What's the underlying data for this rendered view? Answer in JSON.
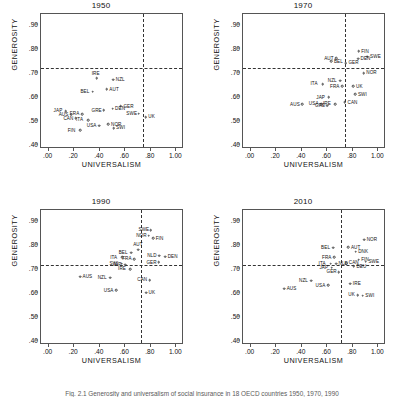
{
  "figure": {
    "caption": "Fig. 2.1 Generosity and universalism of social insurance in 18 OECD countries 1950, 1970, 1990",
    "axis_x_label": "UNIVERSALISM",
    "axis_y_label": "GENEROSITY",
    "xticks": [
      ".00",
      ".20",
      ".40",
      ".60",
      ".80",
      "1.00"
    ],
    "xtick_values": [
      0.0,
      0.2,
      0.4,
      0.6,
      0.8,
      1.0
    ],
    "yticks": [
      ".40",
      ".50",
      ".60",
      ".70",
      ".80",
      ".90"
    ],
    "ytick_values": [
      0.4,
      0.5,
      0.6,
      0.7,
      0.8,
      0.9
    ]
  },
  "chart_data": {
    "type": "scatter",
    "xlabel": "UNIVERSALISM",
    "ylabel": "GENEROSITY",
    "xlim": [
      -0.06,
      1.06
    ],
    "ylim": [
      0.385,
      0.945
    ],
    "grid": false,
    "legend": "none",
    "reference_lines": {
      "vertical_x": 0.74,
      "horizontal_y": 0.723,
      "style": "dashed"
    },
    "panels": [
      {
        "title": "1950",
        "reference_x": 0.735,
        "reference_y": 0.723,
        "points": [
          {
            "label": "NZL",
            "x": 0.505,
            "y": 0.672,
            "label_pos": "right"
          },
          {
            "label": "IRE",
            "x": 0.375,
            "y": 0.678,
            "label_pos": "above"
          },
          {
            "label": "AUT",
            "x": 0.455,
            "y": 0.632,
            "label_pos": "right"
          },
          {
            "label": "BEL",
            "x": 0.345,
            "y": 0.622,
            "label_pos": "left"
          },
          {
            "label": "GER",
            "x": 0.565,
            "y": 0.562,
            "label_pos": "right"
          },
          {
            "label": "DEN",
            "x": 0.5,
            "y": 0.552,
            "label_pos": "right"
          },
          {
            "label": "GRE",
            "x": 0.432,
            "y": 0.545,
            "label_pos": "left"
          },
          {
            "label": "SWE",
            "x": 0.705,
            "y": 0.532,
            "label_pos": "left"
          },
          {
            "label": "UK",
            "x": 0.76,
            "y": 0.518,
            "label_pos": "right"
          },
          {
            "label": "JAP",
            "x": 0.135,
            "y": 0.543,
            "label_pos": "left"
          },
          {
            "label": "AUS",
            "x": 0.175,
            "y": 0.528,
            "label_pos": "left"
          },
          {
            "label": "FRA",
            "x": 0.262,
            "y": 0.53,
            "label_pos": "left"
          },
          {
            "label": "CAN",
            "x": 0.212,
            "y": 0.512,
            "label_pos": "left"
          },
          {
            "label": "ITA",
            "x": 0.31,
            "y": 0.505,
            "label_pos": "left"
          },
          {
            "label": "USA",
            "x": 0.395,
            "y": 0.482,
            "label_pos": "left"
          },
          {
            "label": "NOR",
            "x": 0.468,
            "y": 0.487,
            "label_pos": "right"
          },
          {
            "label": "SWI",
            "x": 0.508,
            "y": 0.472,
            "label_pos": "right"
          },
          {
            "label": "FIN",
            "x": 0.245,
            "y": 0.463,
            "label_pos": "left"
          }
        ]
      },
      {
        "title": "1970",
        "reference_x": 0.735,
        "reference_y": 0.723,
        "points": [
          {
            "label": "SWE",
            "x": 0.915,
            "y": 0.768,
            "label_pos": "right"
          },
          {
            "label": "FIN",
            "x": 0.845,
            "y": 0.79,
            "label_pos": "right"
          },
          {
            "label": "DEN",
            "x": 0.84,
            "y": 0.76,
            "label_pos": "right"
          },
          {
            "label": "NOR",
            "x": 0.885,
            "y": 0.7,
            "label_pos": "right"
          },
          {
            "label": "AUT",
            "x": 0.672,
            "y": 0.762,
            "label_pos": "left"
          },
          {
            "label": "BEL",
            "x": 0.632,
            "y": 0.748,
            "label_pos": "right"
          },
          {
            "label": "GER",
            "x": 0.745,
            "y": 0.742,
            "label_pos": "right"
          },
          {
            "label": "NZL",
            "x": 0.7,
            "y": 0.668,
            "label_pos": "left"
          },
          {
            "label": "ITA",
            "x": 0.565,
            "y": 0.655,
            "label_pos": "left"
          },
          {
            "label": "FRA",
            "x": 0.718,
            "y": 0.645,
            "label_pos": "left"
          },
          {
            "label": "UK",
            "x": 0.805,
            "y": 0.645,
            "label_pos": "right"
          },
          {
            "label": "SWI",
            "x": 0.82,
            "y": 0.612,
            "label_pos": "right"
          },
          {
            "label": "JAP",
            "x": 0.61,
            "y": 0.6,
            "label_pos": "left"
          },
          {
            "label": "AUS",
            "x": 0.405,
            "y": 0.57,
            "label_pos": "left"
          },
          {
            "label": "USA",
            "x": 0.552,
            "y": 0.572,
            "label_pos": "left"
          },
          {
            "label": "IRE",
            "x": 0.662,
            "y": 0.572,
            "label_pos": "left"
          },
          {
            "label": "CAN",
            "x": 0.738,
            "y": 0.578,
            "label_pos": "right"
          },
          {
            "label": "GRE",
            "x": 0.6,
            "y": 0.565,
            "label_pos": "left"
          }
        ]
      },
      {
        "title": "1990",
        "reference_x": 0.725,
        "reference_y": 0.718,
        "points": [
          {
            "label": "SWE",
            "x": 0.8,
            "y": 0.862,
            "label_pos": "left"
          },
          {
            "label": "NOR",
            "x": 0.782,
            "y": 0.838,
            "label_pos": "left"
          },
          {
            "label": "FIN",
            "x": 0.818,
            "y": 0.828,
            "label_pos": "right"
          },
          {
            "label": "AUT",
            "x": 0.7,
            "y": 0.78,
            "label_pos": "above"
          },
          {
            "label": "BEL",
            "x": 0.645,
            "y": 0.768,
            "label_pos": "left"
          },
          {
            "label": "NLD",
            "x": 0.868,
            "y": 0.755,
            "label_pos": "left"
          },
          {
            "label": "DEN",
            "x": 0.912,
            "y": 0.752,
            "label_pos": "right"
          },
          {
            "label": "ITA",
            "x": 0.578,
            "y": 0.748,
            "label_pos": "left"
          },
          {
            "label": "FRA",
            "x": 0.672,
            "y": 0.742,
            "label_pos": "left"
          },
          {
            "label": "GER",
            "x": 0.862,
            "y": 0.728,
            "label_pos": "left"
          },
          {
            "label": "SWI",
            "x": 0.572,
            "y": 0.722,
            "label_pos": "left"
          },
          {
            "label": "JAP",
            "x": 0.598,
            "y": 0.718,
            "label_pos": "left"
          },
          {
            "label": "IRE",
            "x": 0.64,
            "y": 0.7,
            "label_pos": "left"
          },
          {
            "label": "NZL",
            "x": 0.48,
            "y": 0.665,
            "label_pos": "left"
          },
          {
            "label": "CAN",
            "x": 0.79,
            "y": 0.655,
            "label_pos": "left"
          },
          {
            "label": "AUS",
            "x": 0.245,
            "y": 0.668,
            "label_pos": "right"
          },
          {
            "label": "USA",
            "x": 0.528,
            "y": 0.612,
            "label_pos": "left"
          },
          {
            "label": "UK",
            "x": 0.762,
            "y": 0.602,
            "label_pos": "right"
          }
        ]
      },
      {
        "title": "2010",
        "reference_x": 0.705,
        "reference_y": 0.718,
        "points": [
          {
            "label": "NOR",
            "x": 0.888,
            "y": 0.822,
            "label_pos": "right"
          },
          {
            "label": "AUT",
            "x": 0.765,
            "y": 0.79,
            "label_pos": "right"
          },
          {
            "label": "BEL",
            "x": 0.648,
            "y": 0.788,
            "label_pos": "left"
          },
          {
            "label": "DNK",
            "x": 0.822,
            "y": 0.772,
            "label_pos": "right"
          },
          {
            "label": "FRA",
            "x": 0.655,
            "y": 0.748,
            "label_pos": "left"
          },
          {
            "label": "FIN",
            "x": 0.845,
            "y": 0.738,
            "label_pos": "right"
          },
          {
            "label": "SWE",
            "x": 0.902,
            "y": 0.73,
            "label_pos": "right"
          },
          {
            "label": "CAN",
            "x": 0.748,
            "y": 0.725,
            "label_pos": "right"
          },
          {
            "label": "ITA",
            "x": 0.628,
            "y": 0.722,
            "label_pos": "left"
          },
          {
            "label": "NLD",
            "x": 0.668,
            "y": 0.722,
            "label_pos": "right"
          },
          {
            "label": "DEU",
            "x": 0.808,
            "y": 0.712,
            "label_pos": "right"
          },
          {
            "label": "JAP",
            "x": 0.635,
            "y": 0.705,
            "label_pos": "left"
          },
          {
            "label": "GER",
            "x": 0.69,
            "y": 0.688,
            "label_pos": "left"
          },
          {
            "label": "NZL",
            "x": 0.475,
            "y": 0.652,
            "label_pos": "left"
          },
          {
            "label": "IRE",
            "x": 0.78,
            "y": 0.64,
            "label_pos": "right"
          },
          {
            "label": "USA",
            "x": 0.605,
            "y": 0.632,
            "label_pos": "left"
          },
          {
            "label": "AUS",
            "x": 0.262,
            "y": 0.618,
            "label_pos": "right"
          },
          {
            "label": "UK",
            "x": 0.838,
            "y": 0.592,
            "label_pos": "left"
          },
          {
            "label": "SWI",
            "x": 0.878,
            "y": 0.59,
            "label_pos": "right"
          }
        ]
      }
    ]
  }
}
